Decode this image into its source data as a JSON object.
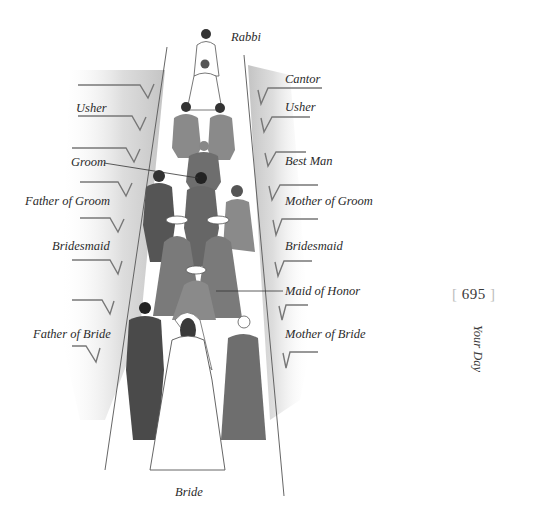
{
  "page": {
    "number": "695",
    "running_head": "Your Day"
  },
  "illustration": {
    "subject": "Jewish wedding processional order, viewed from behind down the aisle",
    "labels": {
      "rabbi": "Rabbi",
      "cantor": "Cantor",
      "usher_left": "Usher",
      "usher_right": "Usher",
      "groom": "Groom",
      "best_man": "Best Man",
      "father_of_groom": "Father of Groom",
      "mother_of_groom": "Mother of Groom",
      "bridesmaid_left": "Bridesmaid",
      "bridesmaid_right": "Bridesmaid",
      "maid_of_honor": "Maid of Honor",
      "father_of_bride": "Father of Bride",
      "mother_of_bride": "Mother of Bride",
      "bride": "Bride"
    },
    "colors": {
      "ink": "#2b2b2b",
      "wash_dark": "#5a5a5a",
      "wash_mid": "#8a8a8a",
      "wash_light": "#c8c8c8",
      "paper": "#ffffff"
    }
  }
}
